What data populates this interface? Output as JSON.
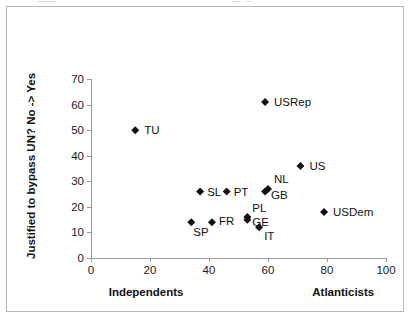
{
  "chart_data": {
    "type": "scatter",
    "title": "",
    "xlabel": "",
    "ylabel": "Justified to bypass UN? No -> Yes",
    "xlim": [
      0,
      100
    ],
    "ylim": [
      0,
      70
    ],
    "xticks": [
      "0",
      "20",
      "40",
      "60",
      "80",
      "100"
    ],
    "yticks": [
      "0",
      "10",
      "20",
      "30",
      "40",
      "50",
      "60",
      "70"
    ],
    "xtick_values": [
      0,
      20,
      40,
      60,
      80,
      100
    ],
    "ytick_values": [
      0,
      10,
      20,
      30,
      40,
      50,
      60,
      70
    ],
    "grid": false,
    "legend": "none",
    "x_axis_anchor_left": "Independents",
    "x_axis_anchor_right": "Atlanticists",
    "marker_style": "filled-diamond",
    "marker_color": "#111111",
    "axis_color": "#9a9a9a",
    "points": [
      {
        "label": "TU",
        "x": 15,
        "y": 50,
        "label_dx": 9,
        "label_dy": -6
      },
      {
        "label": "USRep",
        "x": 59,
        "y": 61,
        "label_dx": 9,
        "label_dy": -6
      },
      {
        "label": "US",
        "x": 71,
        "y": 36,
        "label_dx": 9,
        "label_dy": -6
      },
      {
        "label": "USDem",
        "x": 79,
        "y": 18,
        "label_dx": 9,
        "label_dy": -6
      },
      {
        "label": "SL",
        "x": 37,
        "y": 26,
        "label_dx": 7,
        "label_dy": -6
      },
      {
        "label": "PT",
        "x": 46,
        "y": 26,
        "label_dx": 7,
        "label_dy": -6
      },
      {
        "label": "NL",
        "x": 60,
        "y": 27,
        "label_dx": 6,
        "label_dy": -16
      },
      {
        "label": "GB",
        "x": 59,
        "y": 26,
        "label_dx": 6,
        "label_dy": -3
      },
      {
        "label": "SP",
        "x": 34,
        "y": 14,
        "label_dx": 2,
        "label_dy": 4
      },
      {
        "label": "FR",
        "x": 41,
        "y": 14,
        "label_dx": 7,
        "label_dy": -7
      },
      {
        "label": "PL",
        "x": 53,
        "y": 16,
        "label_dx": 5,
        "label_dy": -15
      },
      {
        "label": "GE",
        "x": 53,
        "y": 15,
        "label_dx": 5,
        "label_dy": -4
      },
      {
        "label": "IT",
        "x": 57,
        "y": 12,
        "label_dx": 5,
        "label_dy": 3
      }
    ]
  }
}
